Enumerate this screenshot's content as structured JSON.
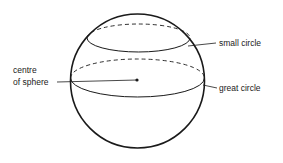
{
  "diagram": {
    "type": "sphere-circles",
    "labels": {
      "centre_line1": "centre",
      "centre_line2": "of sphere",
      "small_circle": "small circle",
      "great_circle": "great circle"
    },
    "colors": {
      "stroke": "#1a1a1a",
      "background": "#ffffff"
    }
  }
}
